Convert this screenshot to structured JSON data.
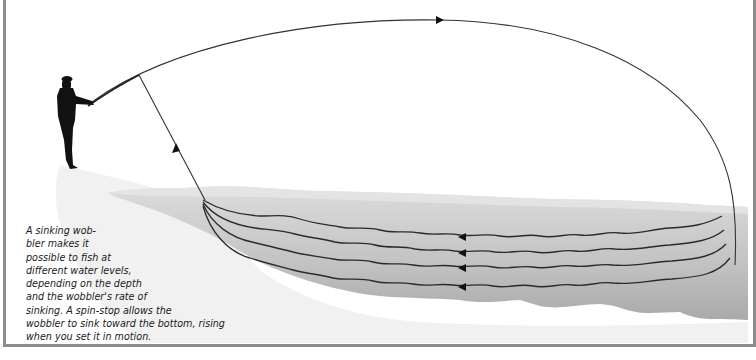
{
  "figure": {
    "caption_lines": [
      "A sinking wob-",
      "bler makes it",
      "possible to fish at",
      "different water levels,",
      "depending on the depth",
      "and the wobbler's rate of",
      "sinking. A spin-stop allows the",
      "wobbler to sink toward the bottom, rising",
      "when you set it in motion."
    ],
    "elements": {
      "angler": "angler-silhouette",
      "cast_arc": "cast-trajectory-with-arrow",
      "line_to_rod": "line-to-rod-with-arrow",
      "retrieve_paths": 4,
      "retrieve_arrow_direction": "left"
    },
    "colors": {
      "frame": "#8c8c8c",
      "line": "#222222",
      "water_light": "#d9d9d9",
      "water_dark": "#b4b4b4",
      "shore": "#ececec"
    }
  }
}
